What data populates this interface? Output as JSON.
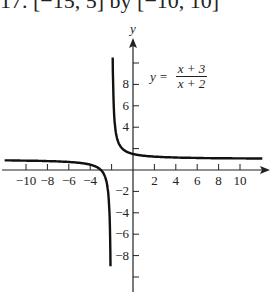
{
  "header": {
    "title": "17. [−15, 5] by [−10, 10]"
  },
  "chart_data": {
    "type": "line",
    "title": "",
    "equation": {
      "lhs": "y =",
      "numerator": "x + 3",
      "denominator": "x + 2"
    },
    "xlabel": "x",
    "ylabel": "y",
    "xlim": [
      -12,
      12.5
    ],
    "ylim": [
      -10.5,
      12
    ],
    "x_ticks": [
      -10,
      -8,
      -6,
      -4,
      -2,
      2,
      4,
      6,
      8,
      10
    ],
    "x_tick_labels": [
      "−10",
      "−8",
      "−6",
      "−4",
      "2",
      "4",
      "6",
      "8",
      "10"
    ],
    "y_ticks": [
      -10,
      -8,
      -6,
      -4,
      -2,
      2,
      4,
      6,
      8,
      10
    ],
    "y_tick_labels": [
      "−8",
      "−6",
      "−4",
      "−2",
      "4",
      "6",
      "8"
    ],
    "vertical_asymptote": -2,
    "horizontal_asymptote": 1,
    "grid": false,
    "series": [
      {
        "name": "left branch",
        "x": [
          -12,
          -10,
          -8,
          -6,
          -4,
          -3,
          -2.5,
          -2.2,
          -2.1
        ],
        "y": [
          0.9,
          0.875,
          0.833,
          0.75,
          0.5,
          0,
          -1,
          -4,
          -9
        ]
      },
      {
        "name": "right branch",
        "x": [
          -1.9,
          -1.8,
          -1.5,
          -1,
          0,
          2,
          4,
          6,
          8,
          10,
          12
        ],
        "y": [
          11,
          6,
          3,
          2,
          1.5,
          1.25,
          1.167,
          1.125,
          1.1,
          1.083,
          1.071
        ]
      }
    ]
  },
  "axis": {
    "x_label": "x",
    "y_label": "y"
  }
}
